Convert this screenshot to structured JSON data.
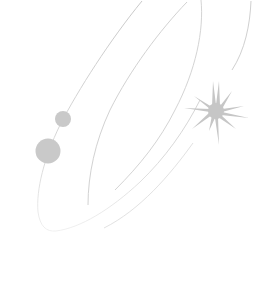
{
  "illustration": {
    "description": "Decorative orbit illustration with two planets and a star",
    "background": "#ffffff",
    "colors": {
      "orbit_line": "#cfcfcf",
      "orbit_line_faint": "#e6e6e6",
      "planet": "#c9c9c9",
      "star": "#c6c6c6"
    },
    "icons": [
      "orbit-lines-icon",
      "planet-small-icon",
      "planet-large-icon",
      "star-icon"
    ]
  }
}
